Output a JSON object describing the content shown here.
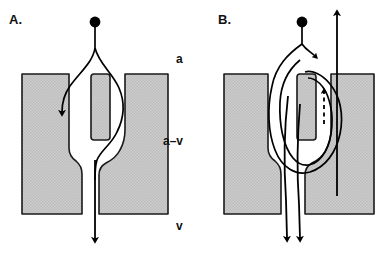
{
  "figure": {
    "background_color": "#ffffff",
    "tissue_fill_color": "#c9c9c9",
    "outline_color": "#1a1a1a",
    "arrow_color": "#000000"
  },
  "panels": [
    {
      "id": "A",
      "letter": "A.",
      "description": "Single inflow branching at a point source; one branch descends at left, the other loops right around the central pillar and rejoins into a single downward outflow arrow."
    },
    {
      "id": "B",
      "letter": "B.",
      "description": "Point source with short branch plus recirculating loops around the central pillar; two parallel downward outflow arrows, a separate straight upward arrow at right, and a dashed upward arrow beside the central pillar."
    }
  ],
  "zone_labels": [
    {
      "key": "arterial",
      "text": "a"
    },
    {
      "key": "arteriovenous",
      "text": "a–v"
    },
    {
      "key": "venous",
      "text": "v"
    }
  ],
  "elements": {
    "source_dot": "source-dot",
    "down_arrow": "down-arrow",
    "up_arrow": "up-arrow",
    "dashed_up_arrow": "dashed-up-arrow",
    "tissue_block_left": "tissue-block-left",
    "tissue_block_right": "tissue-block-right",
    "central_pillar": "central-pillar"
  }
}
